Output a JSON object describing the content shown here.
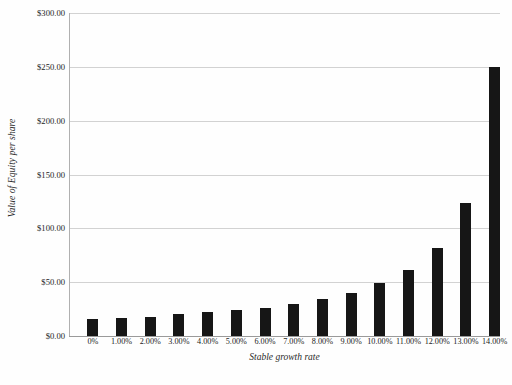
{
  "chart_data": {
    "type": "bar",
    "title": "",
    "xlabel": "Stable growth rate",
    "ylabel": "Value of Equity per share",
    "categories": [
      "0%",
      "1.00%",
      "2.00%",
      "3.00%",
      "4.00%",
      "5.00%",
      "6.00%",
      "7.00%",
      "8.00%",
      "9.00%",
      "10.00%",
      "11.00%",
      "12.00%",
      "13.00%",
      "14.00%"
    ],
    "values": [
      16,
      17,
      18,
      20,
      22,
      24,
      26,
      30,
      34,
      40,
      49,
      61,
      82,
      124,
      250
    ],
    "ylim": [
      0,
      300
    ],
    "ytick_labels": [
      "$0.00",
      "$50.00",
      "$100.00",
      "$150.00",
      "$200.00",
      "$250.00",
      "$300.00"
    ],
    "ytick_values": [
      0,
      50,
      100,
      150,
      200,
      250,
      300
    ],
    "grid": true,
    "legend": false,
    "bar_color": "#161616",
    "gridline_color": "#d2d2d2",
    "background_color": "#fefefe"
  }
}
